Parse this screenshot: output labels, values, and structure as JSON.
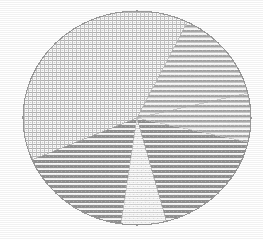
{
  "figure": {
    "title": "",
    "background_color": "#ffffff",
    "render_style": "halftone-dithered-monochrome",
    "canvas_width": 263,
    "canvas_height": 240
  },
  "chart_data": {
    "type": "pie",
    "title": "",
    "xlabel": "",
    "ylabel": "",
    "legend_position": "none",
    "grid": false,
    "center_x": 137,
    "center_y": 118,
    "radius_x": 114,
    "radius_y": 107,
    "start_angle_deg": 62,
    "direction": "counterclockwise",
    "categories": [
      "Slice A",
      "Slice B",
      "Slice C",
      "Slice D",
      "Slice E"
    ],
    "values": [
      41.0,
      13.5,
      4.0,
      12.5,
      29.0
    ],
    "labels": [
      "",
      "",
      "",
      "",
      ""
    ],
    "series": [
      {
        "name": "Slice A",
        "value": 41.0,
        "start_angle_deg": 62,
        "end_angle_deg": 203,
        "fill_pattern": "fine-crosshatch-grid",
        "tone": "light",
        "hex": "#d8d8d8"
      },
      {
        "name": "Slice B",
        "value": 29.0,
        "start_angle_deg": 203,
        "end_angle_deg": 262,
        "fill_pattern": "horizontal-stripes",
        "tone": "medium-dark",
        "hex": "#a0a0a0"
      },
      {
        "name": "Slice C",
        "value": 4.0,
        "start_angle_deg": 262,
        "end_angle_deg": 285,
        "fill_pattern": "near-solid-light",
        "tone": "very-light",
        "hex": "#e8e8e8"
      },
      {
        "name": "Slice D",
        "value": 12.5,
        "start_angle_deg": 285,
        "end_angle_deg": 347,
        "fill_pattern": "horizontal-stripes",
        "tone": "medium-dark",
        "hex": "#a0a0a0"
      },
      {
        "name": "Slice E",
        "value": 13.5,
        "start_angle_deg": 347,
        "end_angle_deg": 422,
        "fill_pattern": "horizontal-stripes-sparse",
        "tone": "medium",
        "hex": "#b4b4b4"
      }
    ],
    "exploded_wedges": [],
    "outline_color": "#9a9a9a"
  },
  "accessibility": {
    "alt_text": "Dithered halftone pie chart with five wedges rendered in black-and-white print patterns"
  }
}
